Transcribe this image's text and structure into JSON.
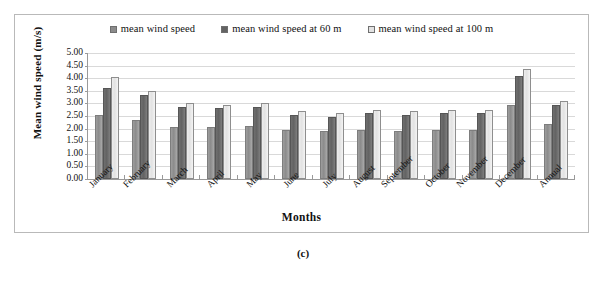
{
  "figure": {
    "caption": "(c)"
  },
  "chart_data": {
    "type": "bar",
    "title": "",
    "xlabel": "Months",
    "ylabel": "Mean wind speed (m/s)",
    "ylim": [
      0.0,
      5.0
    ],
    "ytick_step": 0.5,
    "yticks": [
      "5.00",
      "4.50",
      "4.00",
      "3.50",
      "3.00",
      "2.50",
      "2.00",
      "1.50",
      "1.00",
      "0.50",
      "0.00"
    ],
    "grid": true,
    "legend_position": "top-center",
    "categories": [
      "January",
      "February",
      "March",
      "April",
      "May",
      "June",
      "July",
      "August",
      "September",
      "October",
      "November",
      "December",
      "Annual"
    ],
    "series": [
      {
        "name": "mean wind speed",
        "color": "#8b8b8b",
        "values": [
          2.55,
          2.35,
          2.05,
          2.05,
          2.1,
          1.95,
          1.9,
          1.95,
          1.9,
          1.95,
          1.95,
          2.95,
          2.2
        ]
      },
      {
        "name": "mean wind speed at 60 m",
        "color": "#636363",
        "values": [
          3.6,
          3.35,
          2.85,
          2.8,
          2.85,
          2.55,
          2.45,
          2.6,
          2.55,
          2.6,
          2.6,
          4.1,
          2.95
        ]
      },
      {
        "name": "mean wind speed at 100 m",
        "color": "#e2e2e2",
        "values": [
          4.05,
          3.5,
          3.0,
          2.95,
          3.0,
          2.7,
          2.6,
          2.75,
          2.7,
          2.75,
          2.75,
          4.35,
          3.1
        ]
      }
    ]
  }
}
